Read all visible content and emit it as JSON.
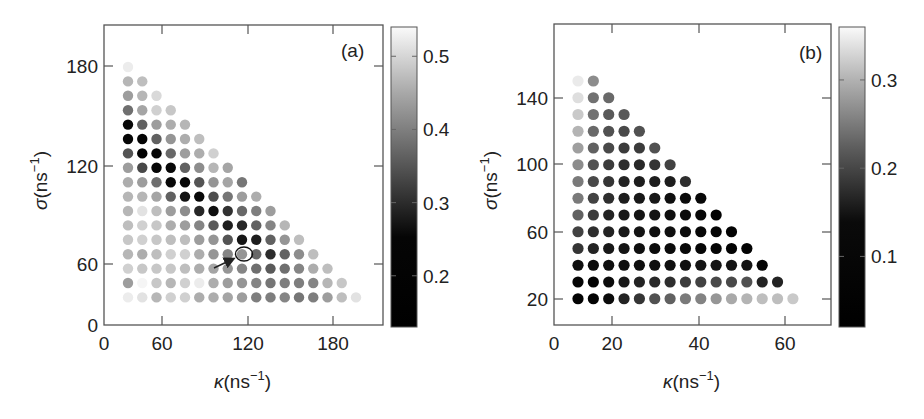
{
  "figure": {
    "panels": [
      {
        "id": "a",
        "panel_label": "(a)",
        "xlabel_symbol": "κ",
        "ylabel_symbol": "σ",
        "unit_text": "(ns",
        "unit_exp": "−1",
        "unit_close": ")",
        "x_ticks": [
          {
            "label": "0",
            "px": 104,
            "corner": true
          },
          {
            "label": "60",
            "px": 162
          },
          {
            "label": "120",
            "px": 248
          },
          {
            "label": "180",
            "px": 333
          }
        ],
        "y_ticks": [
          {
            "label": "0",
            "py": 325,
            "corner": true
          },
          {
            "label": "60",
            "py": 264
          },
          {
            "label": "120",
            "py": 166
          },
          {
            "label": "180",
            "py": 66
          }
        ],
        "colorbar": {
          "ticks": [
            {
              "label": "0.5",
              "value": 0.5
            },
            {
              "label": "0.4",
              "value": 0.4
            },
            {
              "label": "0.3",
              "value": 0.3
            },
            {
              "label": "0.2",
              "value": 0.2
            }
          ],
          "vmin": 0.13,
          "vmax": 0.54
        }
      },
      {
        "id": "b",
        "panel_label": "(b)",
        "xlabel_symbol": "κ",
        "ylabel_symbol": "σ",
        "unit_text": "(ns",
        "unit_exp": "−1",
        "unit_close": ")",
        "x_ticks": [
          {
            "label": "0",
            "px": 554,
            "corner": true
          },
          {
            "label": "20",
            "px": 612
          },
          {
            "label": "40",
            "px": 699
          },
          {
            "label": "60",
            "px": 785
          }
        ],
        "y_ticks": [
          {
            "label": "20",
            "py": 299
          },
          {
            "label": "60",
            "py": 232
          },
          {
            "label": "100",
            "py": 164
          },
          {
            "label": "140",
            "py": 98
          }
        ],
        "colorbar": {
          "ticks": [
            {
              "label": "0.3",
              "value": 0.3
            },
            {
              "label": "0.2",
              "value": 0.2
            },
            {
              "label": "0.1",
              "value": 0.1
            }
          ],
          "vmin": 0.02,
          "vmax": 0.36
        }
      }
    ]
  },
  "chart_data": [
    {
      "type": "heatmap",
      "title": "(a)",
      "xlabel": "κ(ns⁻¹)",
      "ylabel": "σ(ns⁻¹)",
      "xlim": [
        20,
        215
      ],
      "ylim": [
        23,
        217
      ],
      "x_tick_labels": [
        "0",
        "60",
        "120",
        "180"
      ],
      "y_tick_labels": [
        "0",
        "60",
        "120",
        "180"
      ],
      "colorbar": {
        "range": [
          0.13,
          0.54
        ],
        "tick_labels": [
          "0.2",
          "0.3",
          "0.4",
          "0.5"
        ],
        "colormap": "gray (black=low, white=high)"
      },
      "grid": false,
      "annotation": "circled point at κ≈120, σ≈66 indicated by arrow",
      "highlight": {
        "kappa": 120,
        "sigma": 66
      },
      "kappa_start": 36,
      "kappa_step": 10,
      "rows": [
        {
          "sigma": 180,
          "values": [
            0.53
          ]
        },
        {
          "sigma": 171,
          "values": [
            0.47,
            0.48
          ]
        },
        {
          "sigma": 162,
          "values": [
            0.44,
            0.47,
            0.51
          ]
        },
        {
          "sigma": 154,
          "values": [
            0.38,
            0.45,
            0.5,
            0.49
          ]
        },
        {
          "sigma": 145,
          "values": [
            0.18,
            0.36,
            0.44,
            0.46,
            0.47
          ]
        },
        {
          "sigma": 136,
          "values": [
            0.17,
            0.16,
            0.36,
            0.43,
            0.46,
            0.48
          ]
        },
        {
          "sigma": 127,
          "values": [
            0.34,
            0.15,
            0.17,
            0.37,
            0.44,
            0.46,
            0.5
          ]
        },
        {
          "sigma": 119,
          "values": [
            0.44,
            0.32,
            0.17,
            0.18,
            0.36,
            0.42,
            0.47,
            0.45
          ]
        },
        {
          "sigma": 110,
          "values": [
            0.46,
            0.44,
            0.38,
            0.18,
            0.17,
            0.34,
            0.43,
            0.45,
            0.39
          ]
        },
        {
          "sigma": 101,
          "values": [
            0.47,
            0.47,
            0.45,
            0.36,
            0.21,
            0.18,
            0.33,
            0.39,
            0.44,
            0.46
          ]
        },
        {
          "sigma": 92,
          "values": [
            0.47,
            0.52,
            0.48,
            0.44,
            0.42,
            0.26,
            0.2,
            0.28,
            0.37,
            0.4,
            0.44
          ]
        },
        {
          "sigma": 84,
          "values": [
            0.48,
            0.5,
            0.49,
            0.46,
            0.44,
            0.41,
            0.35,
            0.24,
            0.26,
            0.36,
            0.41,
            0.47
          ]
        },
        {
          "sigma": 75,
          "values": [
            0.49,
            0.5,
            0.49,
            0.48,
            0.48,
            0.44,
            0.43,
            0.34,
            0.22,
            0.24,
            0.36,
            0.43,
            0.48
          ]
        },
        {
          "sigma": 66,
          "values": [
            0.47,
            0.46,
            0.48,
            0.5,
            0.5,
            0.46,
            0.43,
            0.41,
            0.43,
            0.37,
            0.27,
            0.36,
            0.42,
            0.48
          ]
        },
        {
          "sigma": 57,
          "values": [
            0.5,
            0.49,
            0.49,
            0.49,
            0.48,
            0.46,
            0.45,
            0.43,
            0.41,
            0.38,
            0.35,
            0.38,
            0.41,
            0.46,
            0.48
          ]
        },
        {
          "sigma": 49,
          "values": [
            0.44,
            0.54,
            0.49,
            0.47,
            0.5,
            0.53,
            0.46,
            0.44,
            0.43,
            0.41,
            0.39,
            0.4,
            0.4,
            0.41,
            0.47,
            0.49
          ]
        },
        {
          "sigma": 40,
          "values": [
            0.53,
            0.52,
            0.47,
            0.5,
            0.5,
            0.46,
            0.46,
            0.45,
            0.44,
            0.4,
            0.4,
            0.41,
            0.39,
            0.4,
            0.44,
            0.48,
            0.52
          ]
        }
      ]
    },
    {
      "type": "heatmap",
      "title": "(b)",
      "xlabel": "κ(ns⁻¹)",
      "ylabel": "σ(ns⁻¹)",
      "xlim": [
        6.6,
        70.6
      ],
      "ylim": [
        4.5,
        184
      ],
      "x_tick_labels": [
        "0",
        "20",
        "40",
        "60"
      ],
      "y_tick_labels": [
        "20",
        "60",
        "100",
        "140"
      ],
      "colorbar": {
        "range": [
          0.02,
          0.36
        ],
        "tick_labels": [
          "0.1",
          "0.2",
          "0.3"
        ],
        "colormap": "gray (black=low, white=high)"
      },
      "grid": false,
      "kappa_start": 12,
      "kappa_step": 3.57,
      "rows": [
        {
          "sigma": 150,
          "values": [
            0.35,
            0.26
          ]
        },
        {
          "sigma": 140,
          "values": [
            0.34,
            0.23,
            0.22
          ]
        },
        {
          "sigma": 130,
          "values": [
            0.32,
            0.23,
            0.2,
            0.2
          ]
        },
        {
          "sigma": 120,
          "values": [
            0.3,
            0.22,
            0.19,
            0.18,
            0.19
          ]
        },
        {
          "sigma": 110,
          "values": [
            0.28,
            0.21,
            0.18,
            0.16,
            0.16,
            0.19
          ]
        },
        {
          "sigma": 100,
          "values": [
            0.26,
            0.19,
            0.16,
            0.14,
            0.13,
            0.15,
            0.17
          ]
        },
        {
          "sigma": 90,
          "values": [
            0.24,
            0.18,
            0.15,
            0.12,
            0.11,
            0.11,
            0.11,
            0.14
          ]
        },
        {
          "sigma": 80,
          "values": [
            0.24,
            0.17,
            0.14,
            0.11,
            0.1,
            0.1,
            0.08,
            0.07,
            0.06
          ]
        },
        {
          "sigma": 70,
          "values": [
            0.21,
            0.16,
            0.12,
            0.1,
            0.09,
            0.09,
            0.08,
            0.07,
            0.06,
            0.04
          ]
        },
        {
          "sigma": 60,
          "values": [
            0.17,
            0.14,
            0.12,
            0.1,
            0.09,
            0.08,
            0.08,
            0.07,
            0.06,
            0.05,
            0.04
          ]
        },
        {
          "sigma": 50,
          "values": [
            0.15,
            0.12,
            0.1,
            0.09,
            0.08,
            0.07,
            0.07,
            0.06,
            0.05,
            0.05,
            0.04,
            0.04
          ]
        },
        {
          "sigma": 40,
          "values": [
            0.08,
            0.07,
            0.08,
            0.08,
            0.08,
            0.08,
            0.08,
            0.08,
            0.09,
            0.09,
            0.09,
            0.09,
            0.05
          ]
        },
        {
          "sigma": 30,
          "values": [
            0.05,
            0.04,
            0.07,
            0.1,
            0.12,
            0.13,
            0.14,
            0.16,
            0.17,
            0.18,
            0.18,
            0.19,
            0.12,
            0.12
          ]
        },
        {
          "sigma": 20,
          "values": [
            0.04,
            0.04,
            0.07,
            0.12,
            0.15,
            0.19,
            0.21,
            0.24,
            0.25,
            0.27,
            0.29,
            0.3,
            0.31,
            0.31,
            0.32
          ]
        }
      ]
    }
  ]
}
